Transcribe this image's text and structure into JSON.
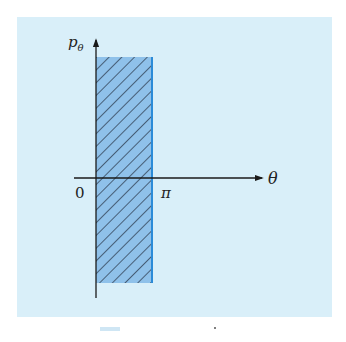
{
  "figure": {
    "panel_color": "#d9eff9",
    "region_fill": "#8fc1ea",
    "hatch_color": "#1f2a3a",
    "edge_color": "#2b8bd8",
    "axis_color": "#1a1a1a"
  },
  "axes": {
    "y_label": "p",
    "y_label_subscript": "θ",
    "x_label": "θ",
    "origin_label": "0",
    "pi_label": "π"
  },
  "region": {
    "description": "Shaded strip 0 ≤ θ ≤ π, extending in both p_θ directions",
    "theta_min": "0",
    "theta_max": "π"
  },
  "caption": {
    "partial_fragment": ""
  }
}
